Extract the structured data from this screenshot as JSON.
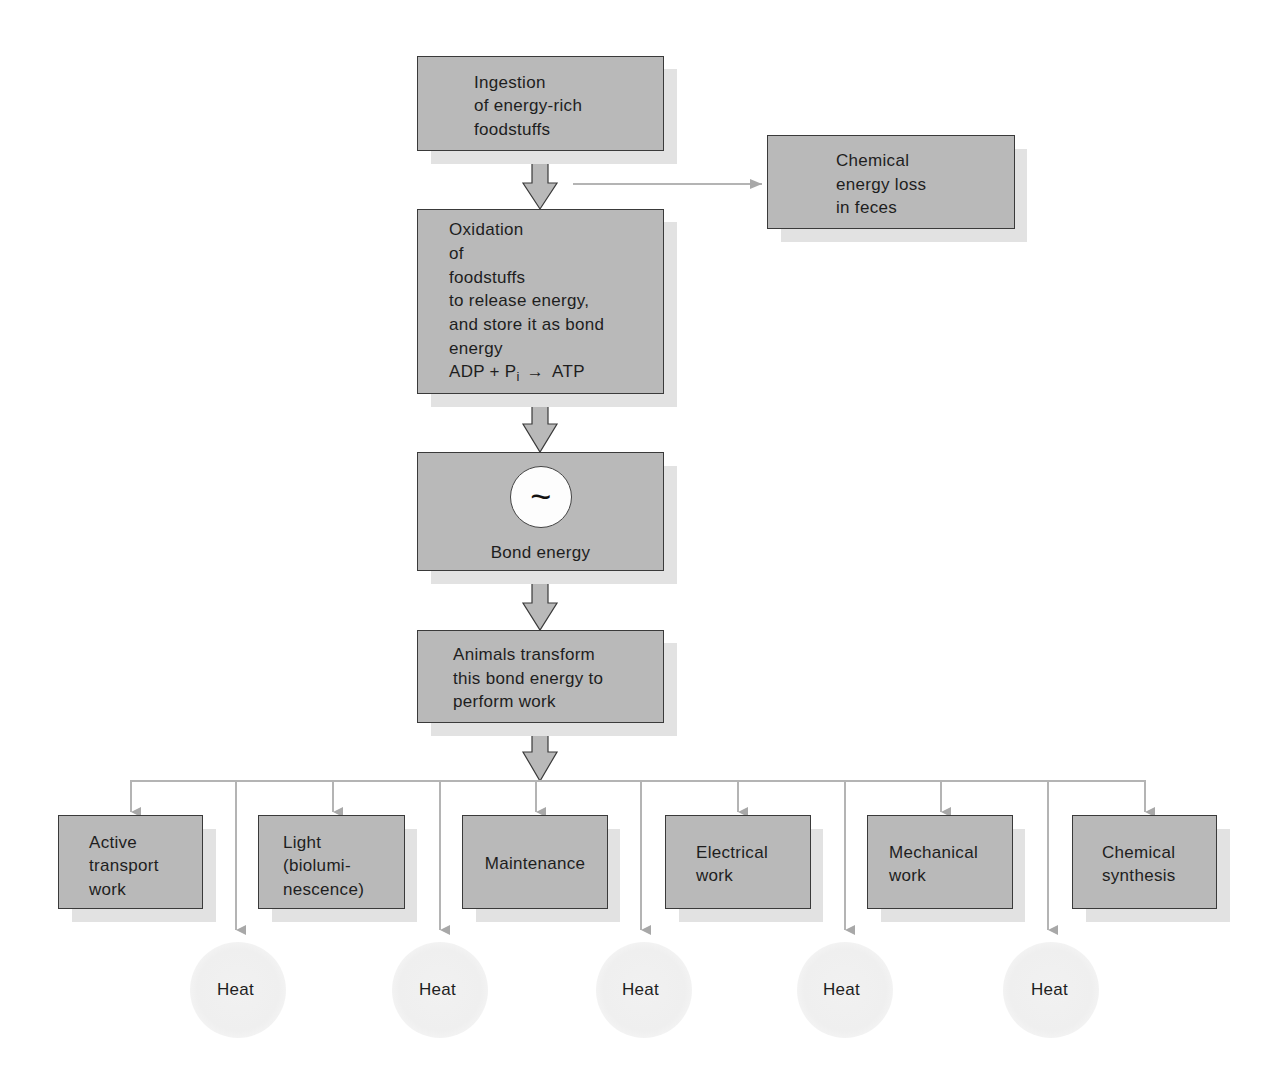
{
  "diagram": {
    "main_flow": {
      "ingestion": {
        "lines": [
          "Ingestion",
          "of energy-rich",
          "foodstuffs"
        ]
      },
      "feces_loss": {
        "lines": [
          "Chemical",
          "energy loss",
          "in feces"
        ]
      },
      "oxidation": {
        "lines": [
          "Oxidation",
          "of",
          "foodstuffs",
          "to release energy,",
          "and store it as bond",
          "energy"
        ],
        "equation": {
          "left": "ADP + P",
          "subscript": "i",
          "arrow": "→",
          "right": "ATP"
        }
      },
      "bond_energy": {
        "symbol": "~",
        "label": "Bond energy"
      },
      "transform": {
        "lines": [
          "Animals transform",
          "this bond energy to",
          "perform work"
        ]
      }
    },
    "work_types": [
      {
        "id": "active-transport",
        "lines": [
          "Active",
          "transport",
          "work"
        ]
      },
      {
        "id": "light",
        "lines": [
          "Light",
          "(biolumi-",
          "nescence)"
        ]
      },
      {
        "id": "maintenance",
        "lines": [
          "Maintenance"
        ]
      },
      {
        "id": "electrical",
        "lines": [
          "Electrical",
          "work"
        ]
      },
      {
        "id": "mechanical",
        "lines": [
          "Mechanical",
          "work"
        ]
      },
      {
        "id": "chemical-synthesis",
        "lines": [
          "Chemical",
          "synthesis"
        ]
      }
    ],
    "heat_outputs": [
      {
        "label": "Heat"
      },
      {
        "label": "Heat"
      },
      {
        "label": "Heat"
      },
      {
        "label": "Heat"
      },
      {
        "label": "Heat"
      }
    ],
    "colors": {
      "box_fill": "#b9b9b9",
      "box_border": "#3a3a3a",
      "box_shadow": "#e2e2e2",
      "connector": "#b4b4b4",
      "heat_fill": "#efefef"
    }
  }
}
